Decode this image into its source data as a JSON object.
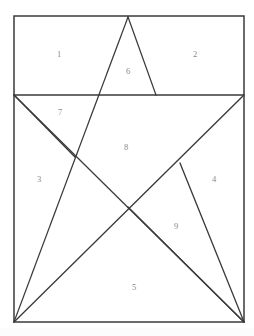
{
  "figure": {
    "title_fragment": "",
    "background_color": "#ffffff",
    "stroke_color": "#3a3a3a",
    "label_color": "#8a8a8a",
    "frame": {
      "name": "bounding-rectangle",
      "left": 14,
      "top": 16,
      "right": 244,
      "bottom": 322
    },
    "divider": {
      "name": "horizontal-divider",
      "y": 95,
      "x_start": 14,
      "x_end": 244
    },
    "star_points": {
      "apex": [
        128,
        17
      ],
      "left_point": [
        14,
        95
      ],
      "right_point": [
        244,
        95
      ],
      "left_foot": [
        14,
        322
      ],
      "right_foot": [
        244,
        322
      ]
    },
    "inner_vertices": {
      "upper_left": [
        100,
        95
      ],
      "upper_right": [
        156,
        95
      ],
      "left": [
        75,
        157
      ],
      "right": [
        180,
        163
      ],
      "bottom": [
        128,
        207
      ]
    },
    "segments": [
      {
        "name": "apex-to-left-foot",
        "from": [
          128,
          17
        ],
        "to": [
          14,
          322
        ]
      },
      {
        "name": "apex-to-upper-right",
        "from": [
          128,
          17
        ],
        "to": [
          156,
          95
        ]
      },
      {
        "name": "left-point-to-right-foot",
        "from": [
          14,
          95
        ],
        "to": [
          244,
          322
        ]
      },
      {
        "name": "right-point-to-left-foot",
        "from": [
          244,
          95
        ],
        "to": [
          14,
          322
        ]
      },
      {
        "name": "left-vertex-spur",
        "from": [
          14,
          95
        ],
        "to": [
          75,
          157
        ]
      },
      {
        "name": "right-vertex-spur",
        "from": [
          180,
          163
        ],
        "to": [
          244,
          322
        ]
      },
      {
        "name": "bottom-vertex-spur",
        "from": [
          128,
          207
        ],
        "to": [
          244,
          322
        ]
      }
    ],
    "region_labels": [
      {
        "id": "region-1",
        "text": "1",
        "x": 59,
        "y": 55
      },
      {
        "id": "region-2",
        "text": "2",
        "x": 195,
        "y": 55
      },
      {
        "id": "region-3",
        "text": "3",
        "x": 39,
        "y": 180
      },
      {
        "id": "region-4",
        "text": "4",
        "x": 214,
        "y": 180
      },
      {
        "id": "region-5",
        "text": "5",
        "x": 134,
        "y": 288
      },
      {
        "id": "region-6",
        "text": "6",
        "x": 128,
        "y": 72
      },
      {
        "id": "region-7",
        "text": "7",
        "x": 60,
        "y": 113
      },
      {
        "id": "region-8",
        "text": "8",
        "x": 126,
        "y": 148
      },
      {
        "id": "region-9",
        "text": "9",
        "x": 176,
        "y": 227
      }
    ]
  }
}
